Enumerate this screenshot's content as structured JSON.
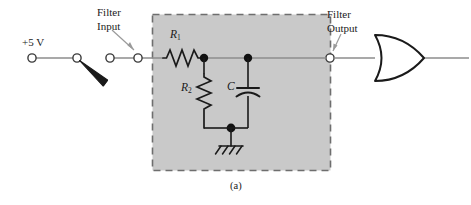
{
  "figure": {
    "caption": "(a)",
    "type": "circuit-schematic"
  },
  "colors": {
    "filter_region_fill": "#c9c9c9",
    "filter_region_border": "#6e6e6e",
    "wire": "#8c8c8c",
    "component_ink": "#1a1a1a",
    "background": "#ffffff",
    "text": "#1a1a1a"
  },
  "annotations": [
    {
      "id": "filter-input",
      "line1": "Filter",
      "line2": "Input",
      "text": "Filter Input"
    },
    {
      "id": "filter-output",
      "line1": "Filter",
      "line2": "Output",
      "text": "Filter Output"
    }
  ],
  "source": {
    "label": "+5 V",
    "terminal_name": "supply-terminal"
  },
  "switch": {
    "name": "spst-switch",
    "state": "open"
  },
  "components": [
    {
      "id": "r1",
      "symbol": "R",
      "subscript": "1",
      "type": "resistor",
      "orientation": "horizontal"
    },
    {
      "id": "r2",
      "symbol": "R",
      "subscript": "2",
      "type": "resistor",
      "orientation": "vertical"
    },
    {
      "id": "c",
      "symbol": "C",
      "subscript": "",
      "type": "capacitor",
      "orientation": "vertical"
    }
  ],
  "ground": {
    "name": "ground-symbol",
    "type": "chassis-ground"
  },
  "gate": {
    "name": "or-gate",
    "type": "OR",
    "inputs": 1,
    "outputs": 1
  },
  "terminals": [
    {
      "id": "t-supply",
      "name": "supply-terminal"
    },
    {
      "id": "t-switch-left",
      "name": "switch-pole-terminal"
    },
    {
      "id": "t-switch-right",
      "name": "switch-throw-terminal"
    },
    {
      "id": "t-filter-input",
      "name": "filter-input-terminal"
    },
    {
      "id": "t-filter-output",
      "name": "filter-output-terminal"
    }
  ]
}
